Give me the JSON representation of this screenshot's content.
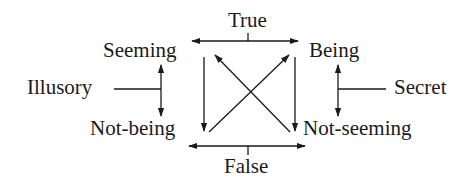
{
  "diagram": {
    "type": "square-of-opposition",
    "colors": {
      "ink": "#1a1a1a",
      "background": "#ffffff"
    },
    "nodes": {
      "top": "True",
      "bottom": "False",
      "top_left": "Seeming",
      "top_right": "Being",
      "bottom_left": "Not-being",
      "bottom_right": "Not-seeming",
      "left": "Illusory",
      "right": "Secret"
    },
    "edges": [
      {
        "from": "True",
        "to": [
          "Seeming",
          "Being"
        ],
        "kind": "bidirectional-horizontal"
      },
      {
        "from": "False",
        "to": [
          "Not-being",
          "Not-seeming"
        ],
        "kind": "bidirectional-horizontal"
      },
      {
        "from": "Illusory",
        "to": [
          "Seeming",
          "Not-being"
        ],
        "kind": "bidirectional-vertical"
      },
      {
        "from": "Secret",
        "to": [
          "Being",
          "Not-seeming"
        ],
        "kind": "bidirectional-vertical"
      },
      {
        "from": "Seeming",
        "to": "Not-being",
        "kind": "arrow"
      },
      {
        "from": "Being",
        "to": "Not-seeming",
        "kind": "arrow"
      },
      {
        "from": "Not-being",
        "to": "Being",
        "kind": "diagonal-arrow"
      },
      {
        "from": "Not-seeming",
        "to": "Seeming",
        "kind": "diagonal-arrow"
      }
    ]
  }
}
